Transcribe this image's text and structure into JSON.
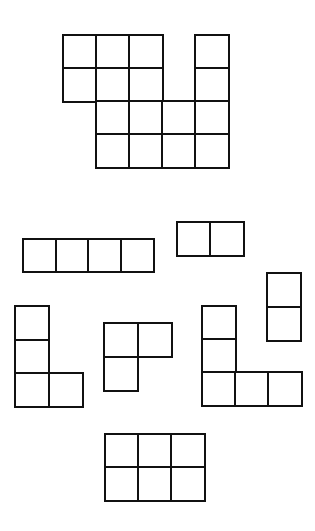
{
  "canvas": {
    "width": 315,
    "height": 531,
    "background": "#ffffff",
    "line_color": "#111111"
  },
  "shapes": [
    {
      "id": "target-figure",
      "label": "composite figure",
      "origin": [
        62,
        34
      ],
      "cell": 33,
      "cells": [
        [
          0,
          0
        ],
        [
          1,
          0
        ],
        [
          2,
          0
        ],
        [
          4,
          0
        ],
        [
          0,
          1
        ],
        [
          1,
          1
        ],
        [
          2,
          1
        ],
        [
          4,
          1
        ],
        [
          1,
          2
        ],
        [
          2,
          2
        ],
        [
          3,
          2
        ],
        [
          4,
          2
        ],
        [
          1,
          3
        ],
        [
          2,
          3
        ],
        [
          3,
          3
        ],
        [
          4,
          3
        ]
      ]
    },
    {
      "id": "piece-i-horizontal",
      "label": "1x4 bar",
      "origin": [
        22,
        238
      ],
      "cell": 32.5,
      "cells": [
        [
          0,
          0
        ],
        [
          1,
          0
        ],
        [
          2,
          0
        ],
        [
          3,
          0
        ]
      ]
    },
    {
      "id": "piece-domino-horizontal",
      "label": "1x2 domino",
      "origin": [
        176,
        221
      ],
      "cell": 33,
      "cells": [
        [
          0,
          0
        ],
        [
          1,
          0
        ]
      ]
    },
    {
      "id": "piece-domino-vertical",
      "label": "2x1 domino",
      "origin": [
        266,
        272
      ],
      "cell": 33.5,
      "cells": [
        [
          0,
          0
        ],
        [
          0,
          1
        ]
      ]
    },
    {
      "id": "piece-l-tetromino",
      "label": "L tetromino",
      "origin": [
        14,
        305
      ],
      "cell": 33.5,
      "cells": [
        [
          0,
          0
        ],
        [
          0,
          1
        ],
        [
          0,
          2
        ],
        [
          1,
          2
        ]
      ]
    },
    {
      "id": "piece-l-tromino",
      "label": "L tromino",
      "origin": [
        103,
        322
      ],
      "cell": 33.5,
      "cells": [
        [
          0,
          0
        ],
        [
          1,
          0
        ],
        [
          0,
          1
        ]
      ]
    },
    {
      "id": "piece-v-pentomino",
      "label": "V pentomino",
      "origin": [
        201,
        305
      ],
      "cell": 33,
      "cells": [
        [
          0,
          0
        ],
        [
          0,
          1
        ],
        [
          0,
          2
        ],
        [
          1,
          2
        ],
        [
          2,
          2
        ]
      ]
    },
    {
      "id": "piece-rect-2x3",
      "label": "2x3 rectangle",
      "origin": [
        104,
        433
      ],
      "cell": 33,
      "cells": [
        [
          0,
          0
        ],
        [
          1,
          0
        ],
        [
          2,
          0
        ],
        [
          0,
          1
        ],
        [
          1,
          1
        ],
        [
          2,
          1
        ]
      ]
    }
  ]
}
